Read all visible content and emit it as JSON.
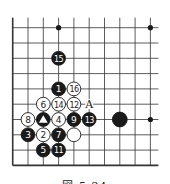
{
  "diagram": {
    "type": "go-board-fragment",
    "grid": {
      "x0": 12.7,
      "y0": 27.7,
      "step": 15.3,
      "cols": 10,
      "rows": 10
    },
    "edges": {
      "left": true,
      "bottom": true,
      "top": false,
      "right": false
    },
    "colors": {
      "line": "#333333",
      "black": "#1a1a1a",
      "white": "#ffffff",
      "label_on_black": "#ffffff",
      "label_on_white": "#222222"
    },
    "hoshi": [
      {
        "col": 3,
        "row": 0
      },
      {
        "col": 9,
        "row": 0
      },
      {
        "col": 9,
        "row": 6
      }
    ],
    "stones": [
      {
        "color": "black",
        "col": 3,
        "row": 4,
        "label": "1"
      },
      {
        "color": "white",
        "col": 2,
        "row": 7,
        "label": "2"
      },
      {
        "color": "black",
        "col": 1,
        "row": 7,
        "label": "3"
      },
      {
        "color": "white",
        "col": 3,
        "row": 6,
        "label": "4"
      },
      {
        "color": "black",
        "col": 2,
        "row": 8,
        "label": "5"
      },
      {
        "color": "white",
        "col": 2,
        "row": 5,
        "label": "6"
      },
      {
        "color": "black",
        "col": 3,
        "row": 7,
        "label": "7"
      },
      {
        "color": "white",
        "col": 1,
        "row": 6,
        "label": "8"
      },
      {
        "color": "black",
        "col": 4,
        "row": 6,
        "label": "9"
      },
      {
        "color": "black",
        "col": 3,
        "row": 8,
        "label": "11"
      },
      {
        "color": "white",
        "col": 4,
        "row": 5,
        "label": "12"
      },
      {
        "color": "black",
        "col": 5,
        "row": 6,
        "label": "13"
      },
      {
        "color": "white",
        "col": 3,
        "row": 5,
        "label": "14"
      },
      {
        "color": "black",
        "col": 3,
        "row": 2,
        "label": "15"
      },
      {
        "color": "white",
        "col": 4,
        "row": 4,
        "label": "16"
      },
      {
        "color": "black",
        "col": 2,
        "row": 6,
        "label": "",
        "marker": "triangle"
      },
      {
        "color": "white",
        "col": 4,
        "row": 7,
        "label": ""
      },
      {
        "color": "black",
        "col": 7,
        "row": 6,
        "label": "",
        "large": true
      }
    ],
    "annotations": [
      {
        "text": "A",
        "col": 5,
        "row": 5
      }
    ]
  },
  "caption": "図 5-24"
}
